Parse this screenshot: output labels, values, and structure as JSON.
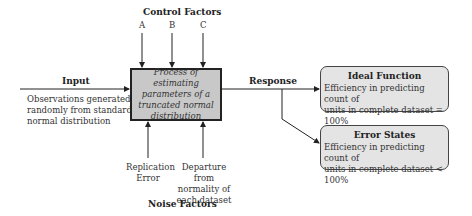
{
  "control": {
    "title": "Control Factors",
    "factors": [
      "A",
      "B",
      "C"
    ]
  },
  "input": {
    "label": "Input",
    "description_lines": [
      "Observations generated",
      "randomly from standard",
      "normal distribution"
    ]
  },
  "process": {
    "lines": [
      "Process of estimating",
      "parameters of a",
      "truncated normal",
      "distribution"
    ]
  },
  "response": {
    "label": "Response"
  },
  "ideal": {
    "title": "Ideal Function",
    "lines": [
      "Efficiency in predicting count of",
      "units in complete dataset = 100%"
    ]
  },
  "error": {
    "title": "Error States",
    "lines": [
      "Efficiency in predicting count of",
      "units in complete dataset < 100%"
    ]
  },
  "noise": {
    "title": "Noise Factors",
    "factors": [
      {
        "lines": [
          "Replication",
          "Error"
        ]
      },
      {
        "lines": [
          "Departure from",
          "normality of",
          "each dataset"
        ]
      }
    ]
  },
  "colors": {
    "process_fill": "#c8c8c8",
    "output_fill": "#e4e4e4",
    "line": "#222222"
  }
}
